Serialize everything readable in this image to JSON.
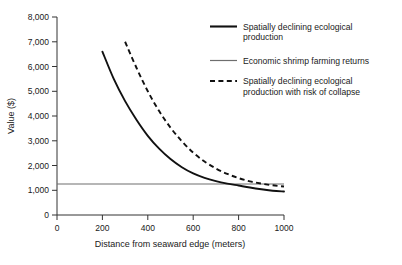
{
  "chart_data": {
    "type": "line",
    "title": "",
    "xlabel": "Distance from seaward edge (meters)",
    "ylabel": "Value ($)",
    "xlim": [
      0,
      1000
    ],
    "ylim": [
      0,
      8000
    ],
    "grid": false,
    "legend_position": "top-right",
    "xticks": [
      "0",
      "200",
      "400",
      "600",
      "800",
      "1000"
    ],
    "xtick_values": [
      0,
      200,
      400,
      600,
      800,
      1000
    ],
    "yticks": [
      "0",
      "1,000",
      "2,000",
      "3,000",
      "4,000",
      "5,000",
      "6,000",
      "7,000",
      "8,000"
    ],
    "ytick_values": [
      0,
      1000,
      2000,
      3000,
      4000,
      5000,
      6000,
      7000,
      8000
    ],
    "series": [
      {
        "name": "Spatially declining ecological production",
        "style": "solid",
        "color": "#111111",
        "width": 1.9,
        "x": [
          200,
          250,
          300,
          350,
          400,
          450,
          500,
          550,
          600,
          650,
          700,
          750,
          800,
          850,
          900,
          950,
          1000
        ],
        "values": [
          6600,
          5500,
          4600,
          3850,
          3200,
          2680,
          2260,
          1930,
          1680,
          1500,
          1370,
          1270,
          1190,
          1110,
          1040,
          980,
          950
        ]
      },
      {
        "name": "Economic shrimp farming returns",
        "style": "solid-thin",
        "color": "#6e6e6e",
        "width": 1.1,
        "x": [
          0,
          1000
        ],
        "values": [
          1250,
          1250
        ]
      },
      {
        "name": "Spatially declining ecological production with risk of collapse",
        "style": "dashed",
        "color": "#111111",
        "width": 1.9,
        "x": [
          300,
          350,
          400,
          450,
          500,
          550,
          600,
          650,
          700,
          750,
          800,
          850,
          900,
          950,
          1000
        ],
        "values": [
          7000,
          5950,
          5000,
          4200,
          3530,
          2980,
          2520,
          2160,
          1880,
          1660,
          1490,
          1360,
          1270,
          1200,
          1150
        ]
      }
    ]
  },
  "legend": {
    "items": [
      {
        "label_line1": "Spatially declining ecological",
        "label_line2": "production",
        "style": "solid"
      },
      {
        "label_line1": "Economic shrimp farming returns",
        "label_line2": "",
        "style": "solid-thin"
      },
      {
        "label_line1": "Spatially declining ecological",
        "label_line2": "production with risk of collapse",
        "style": "dashed"
      }
    ]
  },
  "colors": {
    "axis": "#333333",
    "series_primary": "#111111",
    "series_secondary": "#6e6e6e",
    "background": "#ffffff"
  }
}
